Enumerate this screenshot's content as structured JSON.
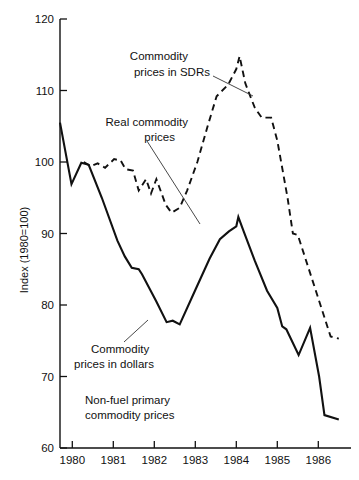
{
  "figure": {
    "clipped_header_fragment": "y",
    "y_axis_title": "Index (1980=100)"
  },
  "chart_data": {
    "type": "line",
    "title": "",
    "subtitle": "",
    "xlabel": "",
    "ylabel": "Index (1980=100)",
    "xlim": [
      1979.7,
      1986.7
    ],
    "ylim": [
      60,
      120
    ],
    "grid": false,
    "legend_position": "inline-annotations",
    "y_ticks": [
      60,
      70,
      80,
      90,
      100,
      110,
      120
    ],
    "x_ticks": [
      1980,
      1981,
      1982,
      1983,
      1984,
      1985,
      1986
    ],
    "x_tick_labels": [
      "1980",
      "1981",
      "1982",
      "1983",
      "1984",
      "1985",
      "1986"
    ],
    "y_tick_labels": [
      "60",
      "70",
      "80",
      "90",
      "100",
      "110",
      "120"
    ],
    "annotations": [
      {
        "id": "sdr-label",
        "text_lines": [
          "Commodity",
          "prices in SDRs"
        ],
        "target_series": "Commodity prices in SDRs"
      },
      {
        "id": "real-label",
        "text_lines": [
          "Real commodity",
          "prices"
        ],
        "target_series": "Real commodity prices"
      },
      {
        "id": "dollar-label",
        "text_lines": [
          "Commodity",
          "prices in dollars"
        ],
        "target_series": "Commodity prices in dollars"
      },
      {
        "id": "chart-caption",
        "text_lines": [
          "Non-fuel primary",
          "commodity prices"
        ],
        "target_series": ""
      }
    ],
    "series": [
      {
        "name": "Commodity prices in dollars",
        "style": "solid",
        "color": "#111111",
        "points": [
          [
            1979.7,
            105.5
          ],
          [
            1979.98,
            96.9
          ],
          [
            1980.22,
            99.9
          ],
          [
            1980.4,
            99.6
          ],
          [
            1980.72,
            95.0
          ],
          [
            1981.1,
            89.0
          ],
          [
            1981.28,
            86.8
          ],
          [
            1981.45,
            85.2
          ],
          [
            1981.62,
            85.0
          ],
          [
            1981.7,
            84.3
          ],
          [
            1982.05,
            80.5
          ],
          [
            1982.3,
            77.6
          ],
          [
            1982.45,
            77.8
          ],
          [
            1982.62,
            77.3
          ],
          [
            1983.0,
            82.1
          ],
          [
            1983.35,
            86.5
          ],
          [
            1983.6,
            89.2
          ],
          [
            1983.82,
            90.3
          ],
          [
            1984.0,
            91.0
          ],
          [
            1984.05,
            92.3
          ],
          [
            1984.18,
            90.3
          ],
          [
            1984.45,
            86.2
          ],
          [
            1984.75,
            82.0
          ],
          [
            1985.0,
            79.6
          ],
          [
            1985.12,
            77.0
          ],
          [
            1985.22,
            76.6
          ],
          [
            1985.52,
            73.0
          ],
          [
            1985.8,
            76.8
          ],
          [
            1986.02,
            70.0
          ],
          [
            1986.15,
            64.6
          ],
          [
            1986.5,
            64.0
          ]
        ]
      },
      {
        "name": "Commodity prices in SDRs",
        "style": "dashed",
        "color": "#111111",
        "points": [
          [
            1980.28,
            100.0
          ],
          [
            1980.45,
            99.4
          ],
          [
            1980.62,
            99.8
          ],
          [
            1980.8,
            99.2
          ],
          [
            1981.02,
            100.4
          ],
          [
            1981.18,
            100.2
          ],
          [
            1981.3,
            99.0
          ],
          [
            1981.48,
            98.8
          ],
          [
            1981.62,
            96.0
          ],
          [
            1981.8,
            97.6
          ],
          [
            1981.92,
            95.6
          ],
          [
            1982.05,
            97.6
          ],
          [
            1982.28,
            94.0
          ],
          [
            1982.42,
            92.9
          ],
          [
            1982.62,
            93.6
          ],
          [
            1982.8,
            96.0
          ],
          [
            1983.05,
            100.0
          ],
          [
            1983.3,
            105.0
          ],
          [
            1983.52,
            109.2
          ],
          [
            1983.8,
            110.8
          ],
          [
            1984.0,
            113.0
          ],
          [
            1984.08,
            114.8
          ],
          [
            1984.22,
            111.0
          ],
          [
            1984.45,
            107.6
          ],
          [
            1984.62,
            106.2
          ],
          [
            1984.85,
            106.2
          ],
          [
            1985.0,
            103.0
          ],
          [
            1985.25,
            95.0
          ],
          [
            1985.38,
            90.0
          ],
          [
            1985.5,
            89.8
          ],
          [
            1986.3,
            75.6
          ],
          [
            1986.5,
            75.3
          ]
        ]
      }
    ]
  }
}
